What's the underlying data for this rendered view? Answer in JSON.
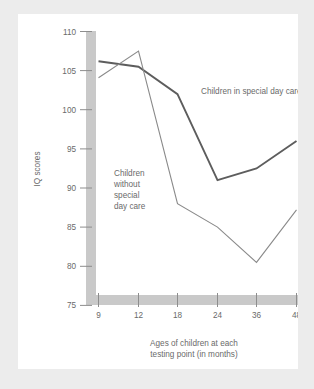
{
  "colors": {
    "page_background": "#ececec",
    "card_background": "#ffffff",
    "axis_band": "#c9c9c9",
    "tick_mark": "#8d8d8d",
    "text": "#6a6a6a",
    "line_special_day_care": "#5d5d5d",
    "line_no_special_care": "#8a8a8a"
  },
  "chart_data": {
    "type": "line",
    "title": "",
    "xlabel": "Ages of children at each testing point (in months)",
    "ylabel": "IQ scores",
    "categories": [
      "9",
      "12",
      "18",
      "24",
      "36",
      "48"
    ],
    "x": [
      9,
      12,
      18,
      24,
      36,
      48
    ],
    "xlim": [
      0,
      5
    ],
    "ylim": [
      75,
      110
    ],
    "yticks": [
      75,
      80,
      85,
      90,
      95,
      100,
      105,
      110
    ],
    "xticks": [
      "9",
      "12",
      "18",
      "24",
      "36",
      "48"
    ],
    "grid": false,
    "legend_position": "inline-annotation",
    "series": [
      {
        "name": "Children in special day care",
        "values": [
          106.2,
          105.5,
          102.0,
          91.0,
          92.5,
          96.0
        ],
        "stroke": "#5d5d5d",
        "width": 1.9
      },
      {
        "name": "Children without special day care",
        "values": [
          104.1,
          107.5,
          88.0,
          85.0,
          80.5,
          87.2
        ],
        "stroke": "#8a8a8a",
        "width": 1.1
      }
    ],
    "annotations": [
      {
        "id": "label-special-day-care",
        "lines": [
          "Children in special day care"
        ],
        "x": 183,
        "y": 80
      },
      {
        "id": "label-without-special-day-care",
        "lines": [
          "Children",
          "without",
          "special",
          "day care"
        ],
        "x": 96,
        "y": 162
      }
    ]
  },
  "axis": {
    "y_title": "IQ scores",
    "y_tick_labels": [
      "110",
      "105",
      "100",
      "95",
      "90",
      "85",
      "80",
      "75"
    ],
    "x_tick_labels": [
      "9",
      "12",
      "18",
      "24",
      "36",
      "48"
    ],
    "x_caption_line1": "Ages of children at each",
    "x_caption_line2": "testing point (in months)"
  },
  "annotations": {
    "special_day_care": "Children in special day care",
    "without_special_day_care_l1": "Children",
    "without_special_day_care_l2": "without",
    "without_special_day_care_l3": "special",
    "without_special_day_care_l4": "day care"
  }
}
